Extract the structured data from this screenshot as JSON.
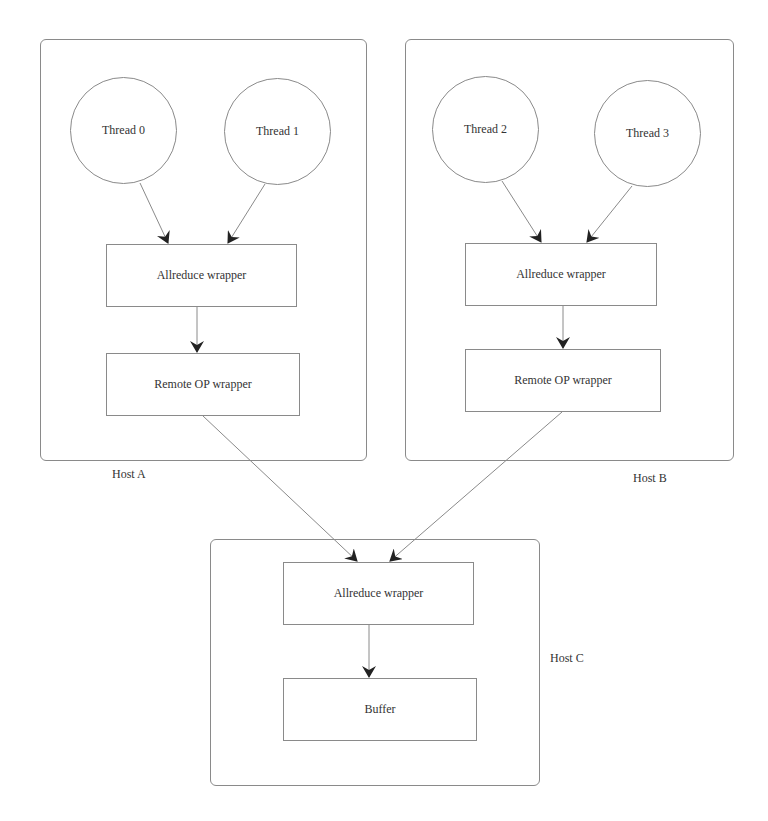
{
  "hosts": {
    "a": {
      "label": "Host A",
      "threads": [
        {
          "label": "Thread 0"
        },
        {
          "label": "Thread 1"
        }
      ],
      "allreduce": "Allreduce wrapper",
      "remote_op": "Remote OP wrapper"
    },
    "b": {
      "label": "Host B",
      "threads": [
        {
          "label": "Thread 2"
        },
        {
          "label": "Thread 3"
        }
      ],
      "allreduce": "Allreduce wrapper",
      "remote_op": "Remote OP wrapper"
    },
    "c": {
      "label": "Host C",
      "allreduce": "Allreduce wrapper",
      "buffer": "Buffer"
    }
  },
  "colors": {
    "stroke": "#8a8a8a",
    "arrowhead": "#222222",
    "text": "#333333"
  }
}
